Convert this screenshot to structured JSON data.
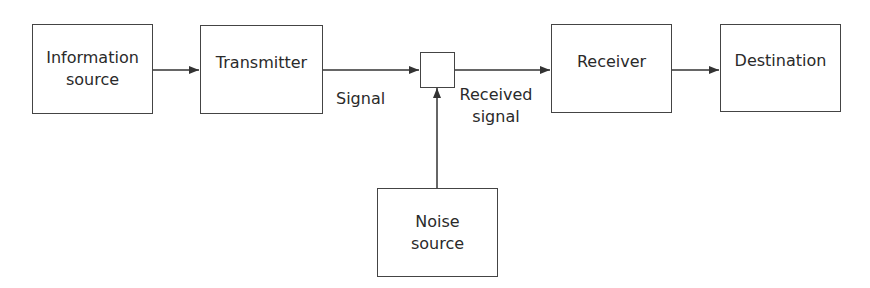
{
  "diagram": {
    "nodes": [
      {
        "id": "info",
        "label": "Information source"
      },
      {
        "id": "tx",
        "label": "Transmitter"
      },
      {
        "id": "mix",
        "label": ""
      },
      {
        "id": "rx",
        "label": "Receiver"
      },
      {
        "id": "dest",
        "label": "Destination"
      },
      {
        "id": "noise",
        "label": "Noise source"
      }
    ],
    "edges": [
      {
        "from": "info",
        "to": "tx",
        "label": ""
      },
      {
        "from": "tx",
        "to": "mix",
        "label": "Signal"
      },
      {
        "from": "mix",
        "to": "rx",
        "label": "Received signal"
      },
      {
        "from": "rx",
        "to": "dest",
        "label": ""
      },
      {
        "from": "noise",
        "to": "mix",
        "label": ""
      }
    ]
  },
  "labels": {
    "info_line1": "Information",
    "info_line2": "source",
    "transmitter": "Transmitter",
    "receiver": "Receiver",
    "destination": "Destination",
    "noise_line1": "Noise",
    "noise_line2": "source",
    "signal": "Signal",
    "received_line1": "Received",
    "received_line2": "signal"
  }
}
